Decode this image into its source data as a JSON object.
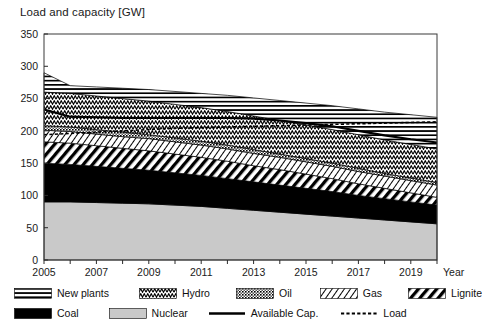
{
  "chart_data": {
    "type": "area",
    "title": "Load and capacity [GW]",
    "xlabel": "Year",
    "ylabel": "Load and capacity [GW]",
    "xlim": [
      2005,
      2020
    ],
    "ylim": [
      0,
      350
    ],
    "yticks": [
      0,
      50,
      100,
      150,
      200,
      250,
      300,
      350
    ],
    "xticks": [
      2005,
      2006,
      2007,
      2008,
      2009,
      2010,
      2011,
      2012,
      2013,
      2014,
      2015,
      2016,
      2017,
      2018,
      2019,
      2020
    ],
    "xtick_labels": [
      "2005",
      "",
      "2007",
      "",
      "2009",
      "",
      "2011",
      "",
      "2013",
      "",
      "2015",
      "",
      "2017",
      "",
      "2019",
      ""
    ],
    "grid": false,
    "legend_position": "below",
    "stacked": true,
    "x": [
      2005,
      2006,
      2007,
      2008,
      2009,
      2010,
      2011,
      2012,
      2013,
      2014,
      2015,
      2016,
      2017,
      2018,
      2019,
      2020
    ],
    "series": [
      {
        "name": "Nuclear",
        "pattern": "solid-light-gray",
        "color": "#c9c9c9",
        "values": [
          90,
          90,
          89,
          88,
          87,
          85,
          83,
          80,
          77,
          74,
          71,
          68,
          65,
          62,
          59,
          56
        ]
      },
      {
        "name": "Coal",
        "pattern": "solid-black",
        "color": "#000000",
        "values": [
          60,
          58,
          56,
          54,
          52,
          50,
          48,
          46,
          44,
          42,
          40,
          38,
          35,
          33,
          31,
          29
        ]
      },
      {
        "name": "Lignite",
        "pattern": "diagonal-thick",
        "color": "#000000",
        "values": [
          33,
          33,
          32,
          31,
          30,
          29,
          28,
          27,
          25,
          24,
          22,
          20,
          18,
          16,
          14,
          12
        ]
      },
      {
        "name": "Gas",
        "pattern": "diagonal-thin",
        "color": "#555555",
        "values": [
          18,
          18,
          18,
          18,
          19,
          19,
          19,
          19,
          19,
          19,
          19,
          19,
          19,
          19,
          19,
          19
        ]
      },
      {
        "name": "Oil",
        "pattern": "dense-dots",
        "color": "#444444",
        "values": [
          7,
          7,
          7,
          7,
          6,
          6,
          6,
          6,
          6,
          5,
          5,
          5,
          5,
          4,
          4,
          4
        ]
      },
      {
        "name": "Hydro",
        "pattern": "zigzag",
        "color": "#333333",
        "values": [
          52,
          52,
          52,
          52,
          52,
          52,
          52,
          52,
          52,
          52,
          52,
          52,
          52,
          52,
          52,
          52
        ]
      },
      {
        "name": "New plants",
        "pattern": "horizontal-lines",
        "color": "#000000",
        "values": [
          30,
          12,
          14,
          16,
          18,
          20,
          22,
          25,
          28,
          31,
          34,
          37,
          40,
          43,
          46,
          49
        ]
      }
    ],
    "lines": [
      {
        "name": "Available Cap.",
        "style": "solid",
        "color": "#000000",
        "values": [
          233,
          222,
          221,
          220,
          220,
          220,
          220,
          220,
          219,
          216,
          212,
          207,
          200,
          193,
          187,
          182
        ]
      },
      {
        "name": "Load",
        "style": "dashed",
        "color": "#000000",
        "values": [
          194,
          196,
          198,
          200,
          202,
          204,
          205,
          206,
          207,
          208,
          209,
          210,
          211,
          212,
          213,
          214
        ]
      }
    ],
    "legend_entries": [
      {
        "label": "New plants",
        "pattern": "horizontal-lines"
      },
      {
        "label": "Hydro",
        "pattern": "zigzag"
      },
      {
        "label": "Oil",
        "pattern": "dense-dots"
      },
      {
        "label": "Gas",
        "pattern": "diagonal-thin"
      },
      {
        "label": "Lignite",
        "pattern": "diagonal-thick"
      },
      {
        "label": "Coal",
        "pattern": "solid-black"
      },
      {
        "label": "Nuclear",
        "pattern": "solid-light-gray"
      },
      {
        "label": "Available Cap.",
        "pattern": "line-solid"
      },
      {
        "label": "Load",
        "pattern": "line-dashed"
      }
    ]
  },
  "axis": {
    "title": "Load and capacity [GW]",
    "x_axis_name": "Year",
    "ytick_labels": [
      "350",
      "300",
      "250",
      "200",
      "150",
      "100",
      "50",
      "0"
    ],
    "xtick_labels": [
      "2005",
      "2007",
      "2009",
      "2011",
      "2013",
      "2015",
      "2017",
      "2019"
    ]
  },
  "legend": {
    "row1": [
      "New plants",
      "Hydro",
      "Oil",
      "Gas",
      "Lignite"
    ],
    "row2": [
      "Coal",
      "Nuclear",
      "Available Cap.",
      "Load"
    ]
  }
}
